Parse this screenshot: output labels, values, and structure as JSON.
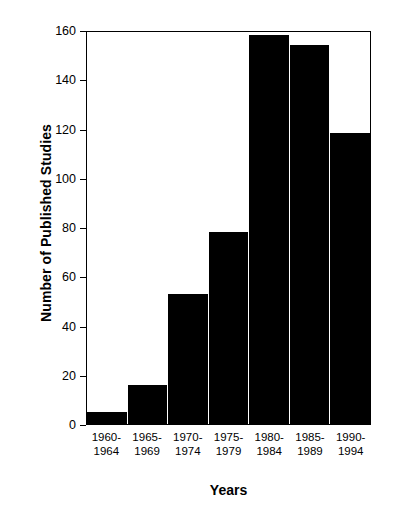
{
  "chart_data": {
    "type": "bar",
    "title": "",
    "categories": [
      "1960-\n1964",
      "1965-\n1969",
      "1970-\n1974",
      "1975-\n1979",
      "1980-\n1984",
      "1985-\n1989",
      "1990-\n1994"
    ],
    "values": [
      5,
      16,
      53,
      78,
      158,
      154,
      118
    ],
    "xlabel": "Years",
    "ylabel": "Number of Published Studies",
    "ylim": [
      0,
      160
    ],
    "yticks": [
      0,
      20,
      40,
      60,
      80,
      100,
      120,
      140,
      160
    ],
    "ytick_labels": [
      "0",
      "20",
      "40",
      "60",
      "80",
      "100",
      "120",
      "140",
      "160"
    ],
    "grid": false,
    "legend": null,
    "bar_color": "#000000",
    "background_color": "#ffffff",
    "axis_color": "#000000"
  }
}
